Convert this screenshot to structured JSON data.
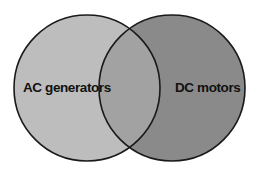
{
  "diagram": {
    "type": "venn",
    "sets": [
      {
        "label": "AC generators",
        "color": "#bdbdbd"
      },
      {
        "label": "DC motors",
        "color": "#8a8a8a"
      }
    ],
    "intersection_color": "#a2a2a2",
    "outline_color": "#1a1a1a"
  }
}
